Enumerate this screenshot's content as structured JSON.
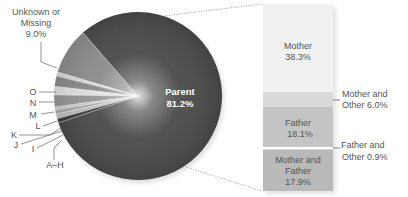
{
  "chart_data": [
    {
      "type": "pie",
      "title": "",
      "center_label": "Parent 81.2%",
      "slices": [
        {
          "label": "Parent",
          "value": 81.2,
          "value_label": "81.2%",
          "color": "#4a4a4a"
        },
        {
          "label": "Unknown or Missing",
          "value": 9.0,
          "value_label": "9.0%",
          "color": "#8c8c8c"
        },
        {
          "label": "O",
          "value": 0.8,
          "color": "#d8d8d8"
        },
        {
          "label": "N",
          "value": 2.0,
          "color": "#8a8a8a"
        },
        {
          "label": "M",
          "value": 1.6,
          "color": "#e0e0e0"
        },
        {
          "label": "L",
          "value": 2.3,
          "color": "#959595"
        },
        {
          "label": "K",
          "value": 0.6,
          "color": "#c8c8c8"
        },
        {
          "label": "J",
          "value": 0.8,
          "color": "#a8a8a8"
        },
        {
          "label": "I",
          "value": 0.9,
          "color": "#bcbcbc"
        },
        {
          "label": "A–H",
          "value": 0.8,
          "color": "#3a3a3a"
        }
      ]
    },
    {
      "type": "bar",
      "stacked": true,
      "title": "Breakdown of Parent",
      "categories": [
        "Mother",
        "Mother and Other",
        "Father",
        "Father and Other",
        "Mother and Father"
      ],
      "values": [
        38.3,
        6.0,
        18.1,
        0.9,
        17.9
      ],
      "value_labels": [
        "38.3%",
        "6.0%",
        "18.1%",
        "0.9%",
        "17.9%"
      ],
      "colors": [
        "#f1f1f1",
        "#d9d9d9",
        "#c4c4c4",
        "#ffffff",
        "#b9b9b9"
      ],
      "total": 81.2
    }
  ],
  "labels": {
    "unknown_line1": "Unknown or",
    "unknown_line2": "Missing",
    "unknown_value": "9.0%",
    "parent_name": "Parent",
    "parent_value": "81.2%",
    "o": "O",
    "n": "N",
    "m": "M",
    "l": "L",
    "k": "K",
    "j": "J",
    "i": "I",
    "ah": "A–H",
    "mother_name": "Mother",
    "mother_value": "38.3%",
    "mother_other_line1": "Mother and",
    "mother_other_line2": "Other 6.0%",
    "father_name": "Father",
    "father_value": "18.1%",
    "father_other_line1": "Father and",
    "father_other_line2": "Other 0.9%",
    "mf_line1": "Mother and",
    "mf_line2": "Father",
    "mf_value": "17.9%"
  }
}
